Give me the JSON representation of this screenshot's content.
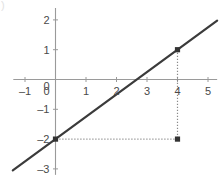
{
  "chart_data": {
    "type": "line",
    "title": "",
    "subtitle": "",
    "xlabel": "",
    "ylabel": "",
    "xlim": [
      -1.4,
      5.3
    ],
    "ylim": [
      -3.2,
      2.4
    ],
    "grid": false,
    "legend": null,
    "x_ticks": [
      -1,
      0,
      1,
      2,
      3,
      4,
      5
    ],
    "x_tick_labels": [
      "–1",
      "0",
      "1",
      "2",
      "3",
      "4",
      "5"
    ],
    "y_ticks": [
      2,
      1,
      0,
      -1,
      -2,
      -3
    ],
    "y_tick_labels": [
      "2",
      "1",
      "0",
      "–1",
      "–2",
      "–3"
    ],
    "series": [
      {
        "name": "line",
        "equation": "y = 0.75x - 2",
        "slope": 0.75,
        "intercept": -2,
        "x": [
          -1.4,
          5.3
        ],
        "values": [
          -3.05,
          1.975
        ],
        "color": "#3b3b3b",
        "style": "solid",
        "width": 2.2
      }
    ],
    "points": [
      {
        "label": "A",
        "x": 0,
        "y": -2,
        "marker": "square",
        "color": "#333333"
      },
      {
        "label": "B",
        "x": 4,
        "y": 1,
        "marker": "square",
        "color": "#333333"
      },
      {
        "label": "C",
        "x": 4,
        "y": -2,
        "marker": "square",
        "color": "#333333"
      }
    ],
    "annotations": [
      {
        "name": "vertical-guide",
        "type": "dotted-segment",
        "from": {
          "x": 4,
          "y": 1
        },
        "to": {
          "x": 4,
          "y": -2
        },
        "color": "#8a8a8a"
      },
      {
        "name": "horizontal-guide",
        "type": "dotted-segment",
        "from": {
          "x": 4,
          "y": -2
        },
        "to": {
          "x": 0,
          "y": -2
        },
        "color": "#8a8a8a"
      }
    ],
    "axis_color": "#9a9a9a",
    "tick_label_color": "#4a4a4a",
    "background": "#ffffff"
  },
  "artifact": {
    "corner_mark": ")"
  }
}
